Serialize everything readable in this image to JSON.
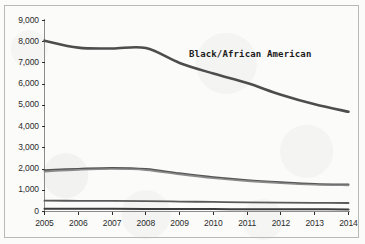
{
  "chart_data": {
    "type": "line",
    "title": "",
    "subtitle": "",
    "xlabel": "",
    "ylabel": "",
    "x": [
      2005,
      2006,
      2007,
      2008,
      2009,
      2010,
      2011,
      2012,
      2013,
      2014
    ],
    "categories": [
      "2005",
      "2006",
      "2007",
      "2008",
      "2009",
      "2010",
      "2011",
      "2012",
      "2013",
      "2014"
    ],
    "xlim": [
      2005,
      2014
    ],
    "ylim": [
      0,
      9000
    ],
    "yticks": [
      0,
      1000,
      2000,
      3000,
      4000,
      5000,
      6000,
      7000,
      8000,
      9000
    ],
    "ytick_labels": [
      "0",
      "1,000",
      "2,000",
      "3,000",
      "4,000",
      "5,000",
      "6,000",
      "7,000",
      "8,000",
      "9,000"
    ],
    "xticks": [
      2005,
      2006,
      2007,
      2008,
      2009,
      2010,
      2011,
      2012,
      2013,
      2014
    ],
    "xtick_labels": [
      "2005",
      "2006",
      "2007",
      "2008",
      "2009",
      "2010",
      "2011",
      "2012",
      "2013",
      "2014"
    ],
    "grid": false,
    "legend": "none",
    "annotations": [
      {
        "text": "Black/African American",
        "x": 2011.0,
        "y": 6850,
        "bold": true
      }
    ],
    "series": [
      {
        "name": "Black/African American",
        "color": "#4d4d4d",
        "width": 2.6,
        "values": [
          8050,
          7720,
          7680,
          7700,
          7000,
          6500,
          6050,
          5500,
          5050,
          4700
        ]
      },
      {
        "name": "series-2",
        "color": "#555555",
        "width": 1.9,
        "values": [
          1950,
          2010,
          2050,
          2000,
          1800,
          1620,
          1480,
          1380,
          1300,
          1270
        ]
      },
      {
        "name": "series-3",
        "color": "#8a8a8a",
        "width": 1.6,
        "values": [
          1880,
          1960,
          2000,
          1950,
          1750,
          1570,
          1430,
          1330,
          1260,
          1230
        ]
      },
      {
        "name": "series-4",
        "color": "#5a5a5a",
        "width": 1.8,
        "values": [
          510,
          505,
          500,
          490,
          470,
          450,
          430,
          415,
          405,
          400
        ]
      },
      {
        "name": "series-5",
        "color": "#3d3d3d",
        "width": 2.0,
        "values": [
          130,
          128,
          125,
          122,
          118,
          114,
          110,
          106,
          103,
          100
        ]
      }
    ]
  },
  "axes": {
    "y_tick_color": "#2b2b2b",
    "x_tick_color": "#2b2b2b",
    "spine_color": "#8c8c8c"
  }
}
